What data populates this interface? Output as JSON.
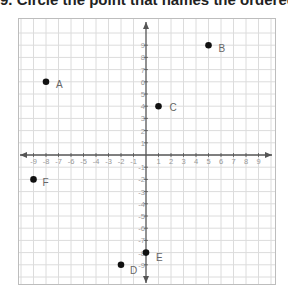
{
  "question": {
    "text": "9. Circle the point that names the ordered"
  },
  "chart_data": {
    "type": "scatter",
    "xlabel": "",
    "ylabel": "",
    "xlim": [
      -9,
      9
    ],
    "ylim": [
      -9,
      9
    ],
    "grid": true,
    "x_tick_labels": [
      "-9",
      "-8",
      "-7",
      "-6",
      "-5",
      "-4",
      "-3",
      "-2",
      "-1",
      "1",
      "2",
      "3",
      "4",
      "5",
      "6",
      "7",
      "8",
      "9"
    ],
    "y_tick_labels": [
      "9",
      "8",
      "7",
      "6",
      "5",
      "4",
      "3",
      "2",
      "1",
      "-1",
      "-2",
      "-3",
      "-4",
      "-5",
      "-6",
      "-7",
      "-8",
      "-9"
    ],
    "points": [
      {
        "label": "A",
        "x": -8,
        "y": 6
      },
      {
        "label": "B",
        "x": 5,
        "y": 9
      },
      {
        "label": "C",
        "x": 1,
        "y": 4
      },
      {
        "label": "D",
        "x": -2,
        "y": -9
      },
      {
        "label": "E",
        "x": 0,
        "y": -8
      },
      {
        "label": "F",
        "x": -9,
        "y": -2
      }
    ]
  },
  "colors": {
    "grid": "#dcdcdc",
    "axis": "#555555",
    "point": "#111111",
    "label": "#666666",
    "tick_label": "#999999"
  }
}
